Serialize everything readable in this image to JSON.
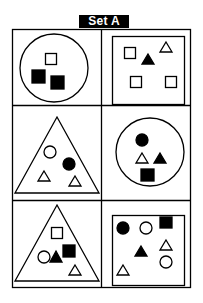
{
  "title": "Set A",
  "colors": {
    "stroke": "#000000",
    "fill": "#000000",
    "background": "#ffffff"
  },
  "panels": [
    {
      "id": "top-left",
      "container": "circle",
      "items": [
        {
          "shape": "square",
          "filled": false
        },
        {
          "shape": "square",
          "filled": true
        },
        {
          "shape": "square",
          "filled": true
        }
      ]
    },
    {
      "id": "top-right",
      "container": "square",
      "items": [
        {
          "shape": "square",
          "filled": false
        },
        {
          "shape": "triangle",
          "filled": true
        },
        {
          "shape": "triangle",
          "filled": false
        },
        {
          "shape": "square",
          "filled": false
        },
        {
          "shape": "square",
          "filled": false
        }
      ]
    },
    {
      "id": "middle-left",
      "container": "triangle",
      "items": [
        {
          "shape": "circle",
          "filled": false
        },
        {
          "shape": "circle",
          "filled": true
        },
        {
          "shape": "triangle",
          "filled": false
        },
        {
          "shape": "triangle",
          "filled": false
        }
      ]
    },
    {
      "id": "middle-right",
      "container": "circle",
      "items": [
        {
          "shape": "circle",
          "filled": true
        },
        {
          "shape": "triangle",
          "filled": false
        },
        {
          "shape": "triangle",
          "filled": true
        },
        {
          "shape": "square",
          "filled": true
        }
      ]
    },
    {
      "id": "bottom-left",
      "container": "triangle",
      "items": [
        {
          "shape": "square",
          "filled": false
        },
        {
          "shape": "square",
          "filled": true
        },
        {
          "shape": "circle",
          "filled": false
        },
        {
          "shape": "triangle",
          "filled": true
        },
        {
          "shape": "triangle",
          "filled": false
        }
      ]
    },
    {
      "id": "bottom-right",
      "container": "square",
      "items": [
        {
          "shape": "circle",
          "filled": true
        },
        {
          "shape": "circle",
          "filled": false
        },
        {
          "shape": "square",
          "filled": true
        },
        {
          "shape": "triangle",
          "filled": false
        },
        {
          "shape": "triangle",
          "filled": true
        },
        {
          "shape": "circle",
          "filled": false
        },
        {
          "shape": "triangle",
          "filled": false
        }
      ]
    }
  ]
}
